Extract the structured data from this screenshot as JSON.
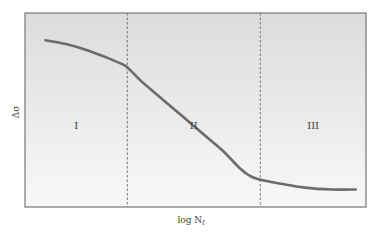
{
  "chart_data": {
    "type": "line",
    "title": "",
    "xlabel": "log N",
    "xlabel_subscript": "f",
    "ylabel": "Δσ",
    "grid": false,
    "legend": null,
    "regions": [
      {
        "label": "I",
        "x_start": 0.0,
        "x_end": 0.3
      },
      {
        "label": "II",
        "x_start": 0.3,
        "x_end": 0.69
      },
      {
        "label": "III",
        "x_start": 0.69,
        "x_end": 1.0
      }
    ],
    "dividers_x": [
      0.3,
      0.69
    ],
    "series": [
      {
        "name": "fatigue-curve",
        "x": [
          0.06,
          0.12,
          0.18,
          0.24,
          0.28,
          0.3,
          0.34,
          0.4,
          0.46,
          0.52,
          0.58,
          0.63,
          0.66,
          0.69,
          0.75,
          0.82,
          0.9,
          0.97
        ],
        "y": [
          0.86,
          0.84,
          0.81,
          0.77,
          0.74,
          0.72,
          0.65,
          0.56,
          0.47,
          0.38,
          0.29,
          0.2,
          0.16,
          0.14,
          0.12,
          0.1,
          0.09,
          0.09
        ]
      }
    ],
    "xlim": [
      0,
      1
    ],
    "ylim": [
      0,
      1
    ],
    "colors": {
      "curve": "#6b6b6b",
      "frame": "#777777",
      "divider": "#666666",
      "bg_top": "#dcdcdc",
      "bg_bottom": "#f8f8f8"
    }
  }
}
